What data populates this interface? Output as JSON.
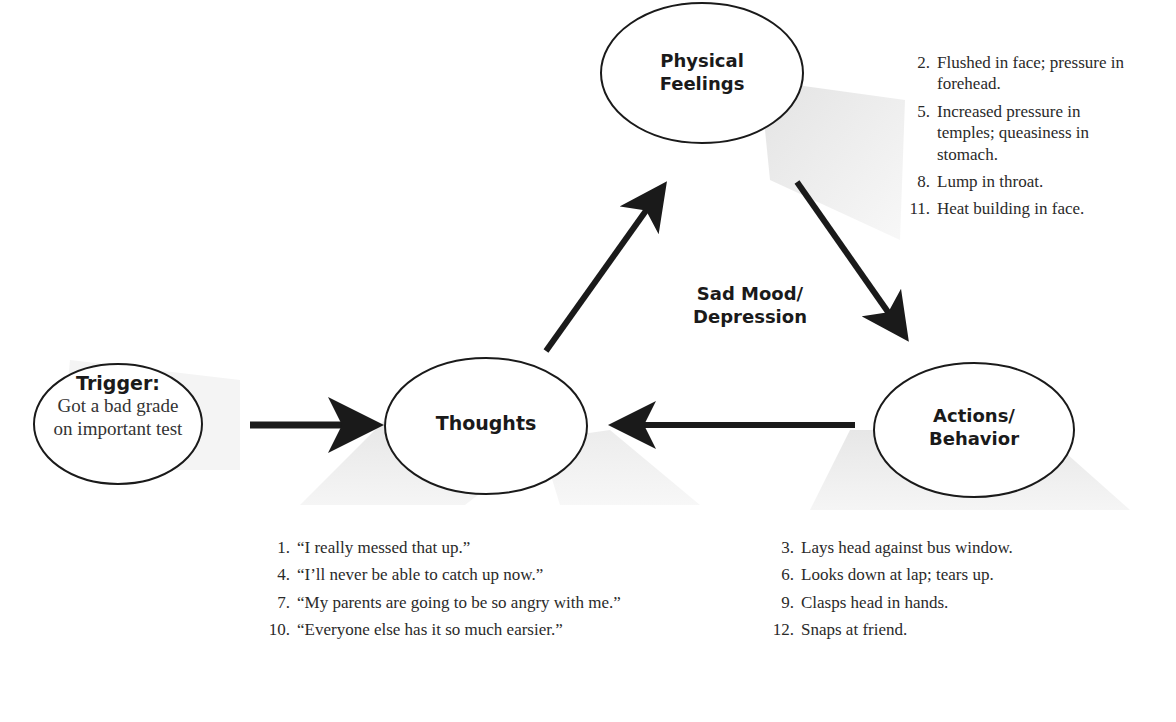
{
  "diagram": {
    "type": "cognitive-behavioral cycle",
    "center_label_line1": "Sad Mood/",
    "center_label_line2": "Depression",
    "nodes": {
      "trigger": {
        "title": "Trigger:",
        "line1": "Got a bad grade",
        "line2": "on important test"
      },
      "thoughts": {
        "label": "Thoughts"
      },
      "physical": {
        "line1": "Physical",
        "line2": "Feelings"
      },
      "actions": {
        "line1": "Actions/",
        "line2": "Behavior"
      }
    },
    "edges": [
      {
        "from": "trigger",
        "to": "thoughts"
      },
      {
        "from": "thoughts",
        "to": "physical"
      },
      {
        "from": "physical",
        "to": "actions"
      },
      {
        "from": "actions",
        "to": "thoughts"
      }
    ],
    "lists": {
      "physical": [
        {
          "num": "2.",
          "text": "Flushed in face; pressure in forehead."
        },
        {
          "num": "5.",
          "text": "Increased pressure in temples; queasiness in stomach."
        },
        {
          "num": "8.",
          "text": "Lump in throat."
        },
        {
          "num": "11.",
          "text": "Heat building in face."
        }
      ],
      "thoughts": [
        {
          "num": "1.",
          "text": "“I really messed that up.”"
        },
        {
          "num": "4.",
          "text": "“I’ll never be able to catch up now.”"
        },
        {
          "num": "7.",
          "text": "“My parents are going to be so angry with me.”"
        },
        {
          "num": "10.",
          "text": "“Everyone else has it so much earsier.”"
        }
      ],
      "actions": [
        {
          "num": "3.",
          "text": "Lays head against bus window."
        },
        {
          "num": "6.",
          "text": "Looks down at lap; tears up."
        },
        {
          "num": "9.",
          "text": "Clasps head in hands."
        },
        {
          "num": "12.",
          "text": "Snaps at friend."
        }
      ]
    },
    "colors": {
      "stroke": "#1a1a1a",
      "shadow": "#e6e6e6"
    }
  }
}
